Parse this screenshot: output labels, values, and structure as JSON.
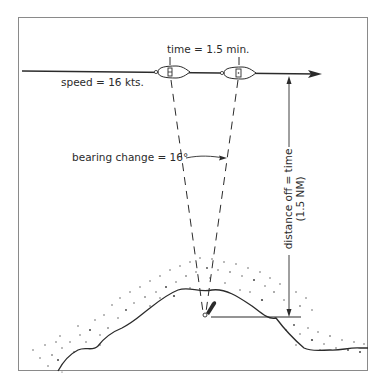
{
  "diagram": {
    "title": "",
    "labels": {
      "time": "time = 1.5 min.",
      "speed": "speed = 16 kts.",
      "bearing_change": "bearing change = 16°",
      "distance_off_line1": "distance off = time",
      "distance_off_line2": "(1.5 NM)"
    },
    "values": {
      "time_min": 1.5,
      "speed_kts": 16,
      "bearing_change_deg": 16,
      "distance_off_nm": 1.5
    },
    "elements": [
      "course-line-with-arrow",
      "boat-position-1",
      "boat-position-2",
      "dashed-bearing-line-1",
      "dashed-bearing-line-2",
      "bearing-change-arc-arrow",
      "distance-off-arrow",
      "lighthouse-landmark",
      "coastline-with-stippled-shoal"
    ],
    "colors": {
      "line": "#2b2b2b",
      "frame": "#8a8a8a",
      "background": "#ffffff"
    }
  }
}
